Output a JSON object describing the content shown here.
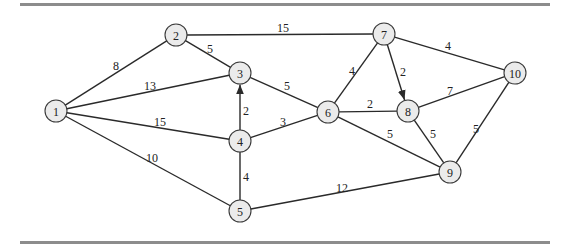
{
  "diagram": {
    "type": "weighted-network",
    "nodes": [
      {
        "id": "1",
        "label": "1",
        "x": 56,
        "y": 111
      },
      {
        "id": "2",
        "label": "2",
        "x": 176,
        "y": 35
      },
      {
        "id": "3",
        "label": "3",
        "x": 240,
        "y": 73
      },
      {
        "id": "4",
        "label": "4",
        "x": 240,
        "y": 141
      },
      {
        "id": "5",
        "label": "5",
        "x": 240,
        "y": 211
      },
      {
        "id": "6",
        "label": "6",
        "x": 328,
        "y": 112
      },
      {
        "id": "7",
        "label": "7",
        "x": 384,
        "y": 34
      },
      {
        "id": "8",
        "label": "8",
        "x": 408,
        "y": 111
      },
      {
        "id": "9",
        "label": "9",
        "x": 450,
        "y": 172
      },
      {
        "id": "10",
        "label": "10",
        "x": 515,
        "y": 73
      }
    ],
    "edges": [
      {
        "from": "1",
        "to": "2",
        "weight": "8",
        "directed": false,
        "lx": 116,
        "ly": 66
      },
      {
        "from": "1",
        "to": "3",
        "weight": "13",
        "directed": false,
        "lx": 150,
        "ly": 86
      },
      {
        "from": "1",
        "to": "4",
        "weight": "15",
        "directed": false,
        "lx": 160,
        "ly": 122
      },
      {
        "from": "1",
        "to": "5",
        "weight": "10",
        "directed": false,
        "lx": 152,
        "ly": 158
      },
      {
        "from": "2",
        "to": "3",
        "weight": "5",
        "directed": false,
        "lx": 210,
        "ly": 49
      },
      {
        "from": "2",
        "to": "7",
        "weight": "15",
        "directed": false,
        "lx": 283,
        "ly": 28
      },
      {
        "from": "3",
        "to": "6",
        "weight": "5",
        "directed": false,
        "lx": 287,
        "ly": 86
      },
      {
        "from": "4",
        "to": "3",
        "weight": "2",
        "directed": true,
        "lx": 246,
        "ly": 111
      },
      {
        "from": "4",
        "to": "6",
        "weight": "3",
        "directed": false,
        "lx": 283,
        "ly": 122
      },
      {
        "from": "4",
        "to": "5",
        "weight": "4",
        "directed": false,
        "lx": 246,
        "ly": 177
      },
      {
        "from": "5",
        "to": "9",
        "weight": "12",
        "directed": false,
        "lx": 342,
        "ly": 188
      },
      {
        "from": "6",
        "to": "7",
        "weight": "4",
        "directed": false,
        "lx": 352,
        "ly": 71
      },
      {
        "from": "6",
        "to": "8",
        "weight": "2",
        "directed": false,
        "lx": 370,
        "ly": 104
      },
      {
        "from": "6",
        "to": "9",
        "weight": "5",
        "directed": false,
        "lx": 390,
        "ly": 134
      },
      {
        "from": "7",
        "to": "8",
        "weight": "2",
        "directed": true,
        "lx": 403,
        "ly": 72
      },
      {
        "from": "7",
        "to": "10",
        "weight": "4",
        "directed": false,
        "lx": 448,
        "ly": 46
      },
      {
        "from": "8",
        "to": "10",
        "weight": "7",
        "directed": false,
        "lx": 450,
        "ly": 91
      },
      {
        "from": "8",
        "to": "9",
        "weight": "5",
        "directed": false,
        "lx": 433,
        "ly": 134
      },
      {
        "from": "10",
        "to": "9",
        "weight": "5",
        "directed": false,
        "lx": 476,
        "ly": 129
      }
    ]
  },
  "style": {
    "node_fill": "#ebebeb",
    "node_stroke": "#3a3a3a",
    "edge_color": "#2a2a2a",
    "rule_color": "#8c8c8c"
  }
}
